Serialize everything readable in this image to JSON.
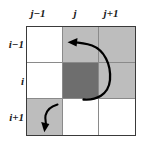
{
  "figure": {
    "title": "",
    "grid": {
      "rows": 3,
      "cols": 3,
      "column_labels": [
        "j−1",
        "j",
        "j+1"
      ],
      "row_labels": [
        "i−1",
        "i",
        "i+1"
      ],
      "cells": [
        [
          {
            "row_label": "i−1",
            "col_label": "j−1",
            "shade": "white"
          },
          {
            "row_label": "i−1",
            "col_label": "j",
            "shade": "light"
          },
          {
            "row_label": "i−1",
            "col_label": "j+1",
            "shade": "light"
          }
        ],
        [
          {
            "row_label": "i",
            "col_label": "j−1",
            "shade": "white"
          },
          {
            "row_label": "i",
            "col_label": "j",
            "shade": "dark"
          },
          {
            "row_label": "i",
            "col_label": "j+1",
            "shade": "light"
          }
        ],
        [
          {
            "row_label": "i+1",
            "col_label": "j−1",
            "shade": "light"
          },
          {
            "row_label": "i+1",
            "col_label": "j",
            "shade": "white"
          },
          {
            "row_label": "i+1",
            "col_label": "j+1",
            "shade": "white"
          }
        ]
      ]
    },
    "colors": {
      "background": "#ffffff",
      "shade_white": "#ffffff",
      "shade_light": "#bdbdbd",
      "shade_dark": "#6e6e6e",
      "grid_outer_border": "#3a3a3a",
      "grid_inner_line": "#8a8a8a",
      "arrow": "#000000",
      "label_text": "#1a1a1a"
    },
    "arrows": [
      {
        "name": "main-loop-arrow",
        "description": "curved loop from bottom of cell (i,j) rightward through (i,j+1) and (i-1,j+1), ending with arrowhead pointing left into cell (i-1,j)",
        "from_cell": "i,j",
        "to_cell": "i−1,j",
        "head_direction": "left"
      },
      {
        "name": "small-s-curve-arrow",
        "description": "short S-shaped curve inside cell (i+1,j-1) running from upper right to lower left",
        "from_cell": "i+1,j−1",
        "to_cell": "i+1,j−1",
        "head_direction": "down-left"
      }
    ]
  }
}
